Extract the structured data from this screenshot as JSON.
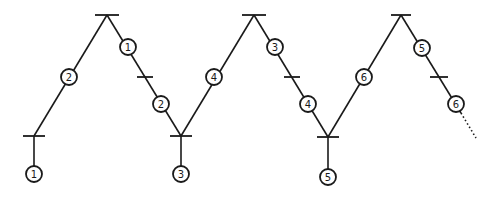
{
  "diagram": {
    "type": "petri-net-zigzag",
    "colors": {
      "stroke": "#1a1a1a",
      "background": "#ffffff"
    },
    "bars": [
      {
        "id": "bar-bottom-1",
        "x": 34,
        "y": 136,
        "w": 22
      },
      {
        "id": "bar-top-1",
        "x": 107,
        "y": 15,
        "w": 24
      },
      {
        "id": "bar-mid-1",
        "x": 145,
        "y": 77,
        "w": 16
      },
      {
        "id": "bar-bottom-2",
        "x": 181,
        "y": 136,
        "w": 22
      },
      {
        "id": "bar-top-2",
        "x": 254,
        "y": 15,
        "w": 24
      },
      {
        "id": "bar-mid-2",
        "x": 292,
        "y": 77,
        "w": 16
      },
      {
        "id": "bar-bottom-3",
        "x": 328,
        "y": 137,
        "w": 22
      },
      {
        "id": "bar-top-3",
        "x": 401,
        "y": 15,
        "w": 20
      },
      {
        "id": "bar-mid-3",
        "x": 439,
        "y": 77,
        "w": 18
      }
    ],
    "nodes": [
      {
        "label": "1",
        "x": 34,
        "y": 174
      },
      {
        "label": "2",
        "x": 69,
        "y": 77
      },
      {
        "label": "1",
        "x": 128,
        "y": 47
      },
      {
        "label": "2",
        "x": 161,
        "y": 104
      },
      {
        "label": "3",
        "x": 181,
        "y": 174
      },
      {
        "label": "4",
        "x": 214,
        "y": 77
      },
      {
        "label": "3",
        "x": 275,
        "y": 47
      },
      {
        "label": "4",
        "x": 308,
        "y": 104
      },
      {
        "label": "5",
        "x": 328,
        "y": 177
      },
      {
        "label": "6",
        "x": 364,
        "y": 77
      },
      {
        "label": "5",
        "x": 422,
        "y": 48
      },
      {
        "label": "6",
        "x": 456,
        "y": 104
      }
    ],
    "continuation": "dotted"
  }
}
